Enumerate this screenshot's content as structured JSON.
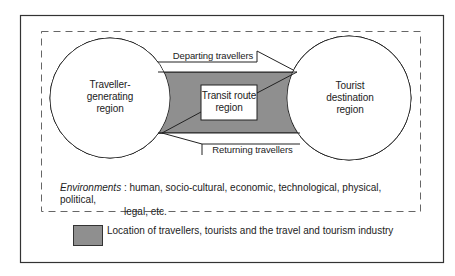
{
  "diagram": {
    "regions": {
      "generating": "Traveller-\ngenerating\nregion",
      "generating_lines": [
        "Traveller-",
        "generating",
        "region"
      ],
      "transit_lines": [
        "Transit route",
        "region"
      ],
      "destination_lines": [
        "Tourist",
        "destination",
        "region"
      ]
    },
    "flows": {
      "departing": "Departing travellers",
      "returning": "Returning travellers"
    },
    "environments": {
      "label": "Environments",
      "separator": " : ",
      "line1": "human, socio-cultural, economic, technological, physical, political,",
      "line2": "legal, etc."
    },
    "legend": {
      "swatch_color": "#8f8f8f",
      "text": "Location of travellers, tourists and the travel and tourism industry"
    },
    "colors": {
      "shaded": "#8f8f8f",
      "line": "#222222"
    }
  }
}
